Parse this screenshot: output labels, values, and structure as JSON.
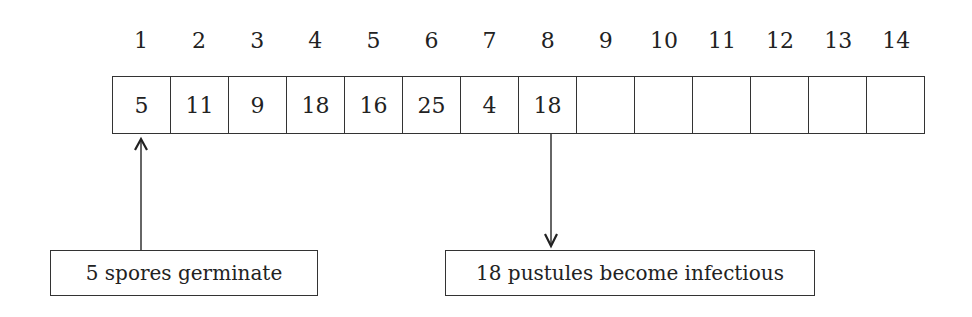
{
  "diagram": {
    "day_numbers": [
      "1",
      "2",
      "3",
      "4",
      "5",
      "6",
      "7",
      "8",
      "9",
      "10",
      "11",
      "12",
      "13",
      "14"
    ],
    "cell_values": [
      "5",
      "11",
      "9",
      "18",
      "16",
      "25",
      "4",
      "18",
      "",
      "",
      "",
      "",
      "",
      ""
    ],
    "annotations": [
      {
        "text": "5 spores germinate",
        "points_to_day": 1,
        "arrow_direction": "up"
      },
      {
        "text": "18 pustules become infectious",
        "points_to_day": 8,
        "arrow_direction": "down"
      }
    ]
  }
}
